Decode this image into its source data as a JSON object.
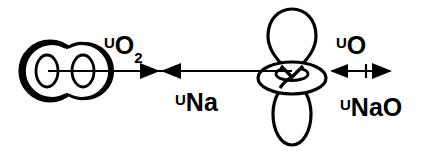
{
  "figure": {
    "type": "scientific-schematic",
    "title": "",
    "background_color": "#ffffff",
    "stroke_color": "#000000",
    "width": 437,
    "height": 156
  },
  "labels": {
    "o2_potential": {
      "symbol": "U",
      "subscript": "O",
      "subscript_number": "2",
      "full": "U O2"
    },
    "na_potential": {
      "symbol": "U",
      "subscript": "Na",
      "full": "U Na"
    },
    "o_potential": {
      "symbol": "U",
      "subscript": "O",
      "full": "U O"
    },
    "nao_potential": {
      "symbol": "U",
      "subscript": "NaO",
      "full": "U NaO"
    }
  },
  "shapes": {
    "o2_molecule": {
      "name": "oxygen-molecule",
      "description": "two overlapping circles with inner ellipses"
    },
    "p_orbital": {
      "name": "p-orbital-with-torus",
      "description": "vertical dumbbell lobes with horizontal ring at node"
    }
  },
  "arrows": {
    "o2_arrow": {
      "direction": "right"
    },
    "na_arrow": {
      "direction": "left"
    },
    "nao_arrow": {
      "direction": "both"
    }
  }
}
